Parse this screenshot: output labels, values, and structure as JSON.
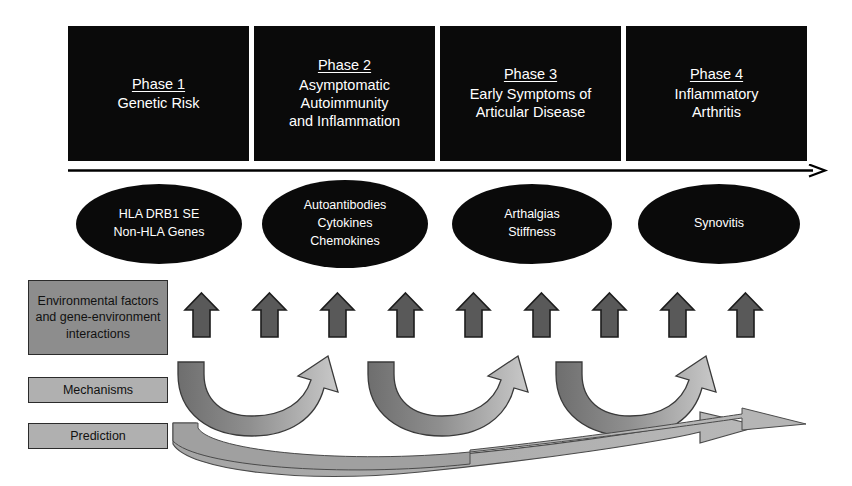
{
  "diagram": {
    "colors": {
      "box_fill": "#0a0a0a",
      "box_text": "#ffffff",
      "ellipse_fill": "#0a0a0a",
      "ellipse_text": "#ffffff",
      "side_label_dark": "#8d8d8d",
      "side_label_light": "#b0b0b0",
      "up_arrow_fill": "#595959",
      "up_arrow_stroke": "#1a1a1a",
      "curve_arrow_dark": "#6e6e6e",
      "curve_arrow_light": "#c2c2c2",
      "prediction_arrow_fill": "#a8a8a8",
      "timeline_arrow": "#000000"
    }
  },
  "phases": [
    {
      "title": "Phase 1",
      "subtitle_lines": [
        "Genetic Risk"
      ]
    },
    {
      "title": "Phase 2",
      "subtitle_lines": [
        "Asymptomatic",
        "Autoimmunity",
        "and Inflammation"
      ]
    },
    {
      "title": "Phase 3",
      "subtitle_lines": [
        "Early Symptoms of",
        "Articular Disease"
      ]
    },
    {
      "title": "Phase 4",
      "subtitle_lines": [
        "Inflammatory",
        "Arthritis"
      ]
    }
  ],
  "nodes": [
    {
      "lines": [
        "HLA DRB1 SE",
        "Non-HLA Genes"
      ]
    },
    {
      "lines": [
        "Autoantibodies",
        "Cytokines",
        "Chemokines"
      ]
    },
    {
      "lines": [
        "Arthalgias",
        "Stiffness"
      ]
    },
    {
      "lines": [
        "Synovitis"
      ]
    }
  ],
  "side_labels": [
    {
      "text": "Environmental factors and gene-environment interactions",
      "tone": "dark"
    },
    {
      "text": "Mechanisms",
      "tone": "light"
    },
    {
      "text": "Prediction",
      "tone": "light"
    }
  ],
  "up_arrows": {
    "count": 9,
    "label": "contributing-factor-arrow"
  },
  "mechanism_arrows": {
    "count": 3,
    "label": "mechanism-curved-arrow"
  },
  "prediction_arrows": {
    "count": 1,
    "label": "prediction-sweeping-arrow"
  },
  "timeline": {
    "label": "progression-timeline-arrow",
    "direction": "left-to-right"
  }
}
